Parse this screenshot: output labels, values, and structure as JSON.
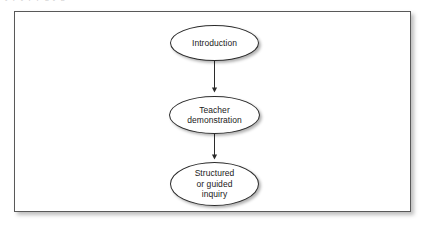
{
  "figure": {
    "type": "flowchart",
    "orientation": "vertical-top-to-bottom",
    "background_color": "#ffffff",
    "frame_border_color": "#595959",
    "node_stroke_color": "#2b2b2b",
    "node_fill_color": "#ffffff",
    "arrow_color": "#2b2b2b",
    "crop_artifact_text": "i   y   p   y   p   p   g   y   g",
    "nodes": [
      {
        "id": "introduction",
        "label": "Introduction",
        "shape": "ellipse",
        "order": 1
      },
      {
        "id": "teacher-demonstration",
        "label": "Teacher\ndemonstration",
        "shape": "ellipse",
        "order": 2
      },
      {
        "id": "structured-inquiry",
        "label": "Structured\nor guided\ninquiry",
        "shape": "ellipse",
        "order": 3
      }
    ],
    "connectors": [
      {
        "id": "arrow-1",
        "from": "introduction",
        "to": "teacher-demonstration",
        "style": "solid-arrow-down"
      },
      {
        "id": "arrow-2",
        "from": "teacher-demonstration",
        "to": "structured-inquiry",
        "style": "solid-arrow-down"
      }
    ]
  }
}
